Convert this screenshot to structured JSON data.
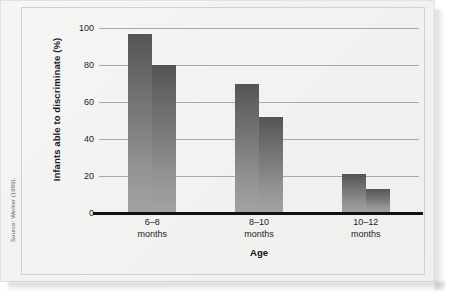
{
  "figure": {
    "source_credit": "Source: Werker (1989).",
    "background_color": "#f2f2f0",
    "bar_color_top": "#545454",
    "bar_color_bottom": "#a3a3a3",
    "axis_color": "#111111",
    "gridline_color": "#a9a9a9"
  },
  "chart_data": {
    "type": "bar",
    "title": "",
    "xlabel": "Age",
    "ylabel": "Infants able to discriminate (%)",
    "ylim": [
      0,
      100
    ],
    "yticks": [
      0,
      20,
      40,
      60,
      80,
      100
    ],
    "ytick_labels": [
      "0",
      "20",
      "40",
      "60",
      "80",
      "100"
    ],
    "grid": true,
    "legend": false,
    "legend_position": "none",
    "categories": [
      "6–8\nmonths",
      "8–10\nmonths",
      "10–12\nmonths"
    ],
    "category_lines": [
      [
        "6–8",
        "months"
      ],
      [
        "8–10",
        "months"
      ],
      [
        "10–12",
        "months"
      ]
    ],
    "series": [
      {
        "name": "Series 1",
        "values": [
          97,
          70,
          21
        ]
      },
      {
        "name": "Series 2",
        "values": [
          80,
          52,
          13
        ]
      }
    ],
    "bars": [
      {
        "category": "6–8 months",
        "series": "Series 1",
        "value": 97
      },
      {
        "category": "6–8 months",
        "series": "Series 2",
        "value": 80
      },
      {
        "category": "8–10 months",
        "series": "Series 1",
        "value": 70
      },
      {
        "category": "8–10 months",
        "series": "Series 2",
        "value": 52
      },
      {
        "category": "10–12 months",
        "series": "Series 1",
        "value": 21
      },
      {
        "category": "10–12 months",
        "series": "Series 2",
        "value": 13
      }
    ]
  }
}
